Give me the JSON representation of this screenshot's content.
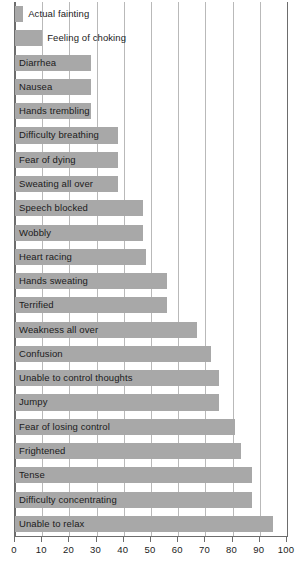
{
  "chart_data": {
    "type": "bar",
    "orientation": "horizontal",
    "title": "",
    "xlabel": "",
    "ylabel": "",
    "xlim": [
      0,
      100
    ],
    "xticks": [
      0,
      10,
      20,
      30,
      40,
      50,
      60,
      70,
      80,
      90,
      100
    ],
    "xtick_labels": [
      "0",
      "10",
      "20",
      "30",
      "40",
      "50",
      "60",
      "70",
      "80",
      "90",
      "100"
    ],
    "grid": true,
    "legend": false,
    "bar_color": "#a8a8a8",
    "axis_color": "#6d6d6d",
    "gridline_color": "#b9b9b9",
    "categories": [
      "Actual fainting",
      "Feeling of choking",
      "Diarrhea",
      "Nausea",
      "Hands trembling",
      "Difficulty breathing",
      "Fear of dying",
      "Sweating all over",
      "Speech blocked",
      "Wobbly",
      "Heart racing",
      "Hands sweating",
      "Terrified",
      "Weakness all over",
      "Confusion",
      "Unable to control thoughts",
      "Jumpy",
      "Fear of losing control",
      "Frightened",
      "Tense",
      "Difficulty concentrating",
      "Unable to relax"
    ],
    "values": [
      3,
      10,
      28,
      28,
      28,
      38,
      38,
      38,
      47,
      47,
      48,
      56,
      56,
      67,
      72,
      75,
      75,
      81,
      83,
      87,
      87,
      95
    ],
    "label_placement": [
      "outside",
      "outside",
      "inside",
      "inside",
      "inside",
      "inside",
      "inside",
      "inside",
      "inside",
      "inside",
      "inside",
      "inside",
      "inside",
      "inside",
      "inside",
      "inside",
      "inside",
      "inside",
      "inside",
      "inside",
      "inside",
      "inside"
    ]
  },
  "caption": {
    "text": ""
  }
}
